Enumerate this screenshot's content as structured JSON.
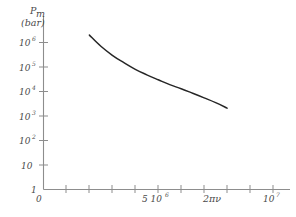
{
  "chart_data": {
    "type": "line",
    "title": "",
    "ylabel_main": "P",
    "ylabel_sub": "m",
    "ylabel_unit": "(bar)",
    "xlabel": "2πν",
    "origin_label": "0",
    "y_scale": "log",
    "x_scale": "linear",
    "ylim": [
      1,
      1000000
    ],
    "xlim": [
      0,
      10000000
    ],
    "grid": false,
    "legend": "none",
    "y_ticks": [
      {
        "value": 1000000,
        "mantissa": "10",
        "exponent": "6",
        "label": "10^6"
      },
      {
        "value": 100000,
        "mantissa": "10",
        "exponent": "5",
        "label": "10^5"
      },
      {
        "value": 10000,
        "mantissa": "10",
        "exponent": "4",
        "label": "10^4"
      },
      {
        "value": 1000,
        "mantissa": "10",
        "exponent": "3",
        "label": "10^3"
      },
      {
        "value": 100,
        "mantissa": "10",
        "exponent": "2",
        "label": "10^2"
      },
      {
        "value": 10,
        "mantissa": "10",
        "exponent": "",
        "label": "10"
      },
      {
        "value": 1,
        "mantissa": "1",
        "exponent": "",
        "label": "1"
      }
    ],
    "x_ticks": [
      {
        "value": 0,
        "label": ""
      },
      {
        "value": 1000000,
        "label": ""
      },
      {
        "value": 2000000,
        "label": ""
      },
      {
        "value": 3000000,
        "label": ""
      },
      {
        "value": 4000000,
        "label": ""
      },
      {
        "value": 5000000,
        "label": "5 10^6",
        "mantissa": "5 10",
        "exponent": "6"
      },
      {
        "value": 6000000,
        "label": ""
      },
      {
        "value": 7000000,
        "label": ""
      },
      {
        "value": 8000000,
        "label": ""
      },
      {
        "value": 9000000,
        "label": ""
      },
      {
        "value": 10000000,
        "label": "10^7",
        "mantissa": "10",
        "exponent": "7"
      }
    ],
    "series": [
      {
        "name": "Pm",
        "x": [
          2000000,
          2500000,
          3000000,
          3500000,
          4000000,
          4500000,
          5000000,
          5500000,
          6000000,
          6500000,
          7000000,
          7500000,
          8000000
        ],
        "y": [
          2000000,
          700000,
          300000,
          150000,
          80000,
          48000,
          30000,
          19000,
          13000,
          8500,
          5500,
          3500,
          2100
        ]
      }
    ],
    "colors": {
      "curve": "#262626",
      "axis": "#8d8d8d",
      "text": "#4a4a4a",
      "background": "#ffffff"
    }
  }
}
